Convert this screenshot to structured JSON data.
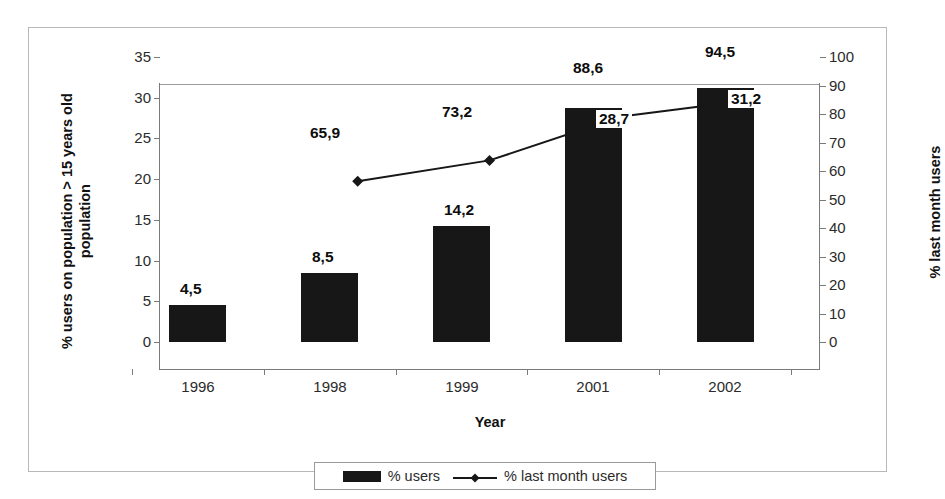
{
  "chart_data": {
    "type": "bar",
    "title": "",
    "xlabel": "Year",
    "categories": [
      "1996",
      "1998",
      "1999",
      "2001",
      "2002"
    ],
    "grid": false,
    "legend_position": "bottom",
    "axes": {
      "left": {
        "label": "% users on population > 15 years old population",
        "min": 0,
        "max": 35,
        "step": 5,
        "ticks": [
          "35",
          "30",
          "25",
          "20",
          "15",
          "10",
          "5",
          "0"
        ]
      },
      "right": {
        "label": "% last month users",
        "min": 0,
        "max": 100,
        "step": 10,
        "ticks": [
          "100",
          "90",
          "80",
          "70",
          "60",
          "50",
          "40",
          "30",
          "20",
          "10",
          "0"
        ]
      }
    },
    "series": [
      {
        "name": "% users",
        "type": "bar",
        "axis": "left",
        "color": "#171717",
        "values": [
          4.5,
          8.5,
          14.2,
          28.7,
          31.2
        ],
        "labels": [
          "4,5",
          "8,5",
          "14,2",
          "28,7",
          "31,2"
        ]
      },
      {
        "name": "% last month users",
        "type": "line",
        "axis": "right",
        "color": "#171717",
        "marker": "diamond",
        "values": [
          null,
          65.9,
          73.2,
          88.6,
          94.5
        ],
        "labels": [
          "",
          "65,9",
          "73,2",
          "88,6",
          "94,5"
        ]
      }
    ]
  },
  "legend": {
    "items": [
      {
        "label": "% users",
        "marker": "filled-rect-swatch"
      },
      {
        "label": "% last month users",
        "marker": "line-with-diamond"
      }
    ]
  }
}
